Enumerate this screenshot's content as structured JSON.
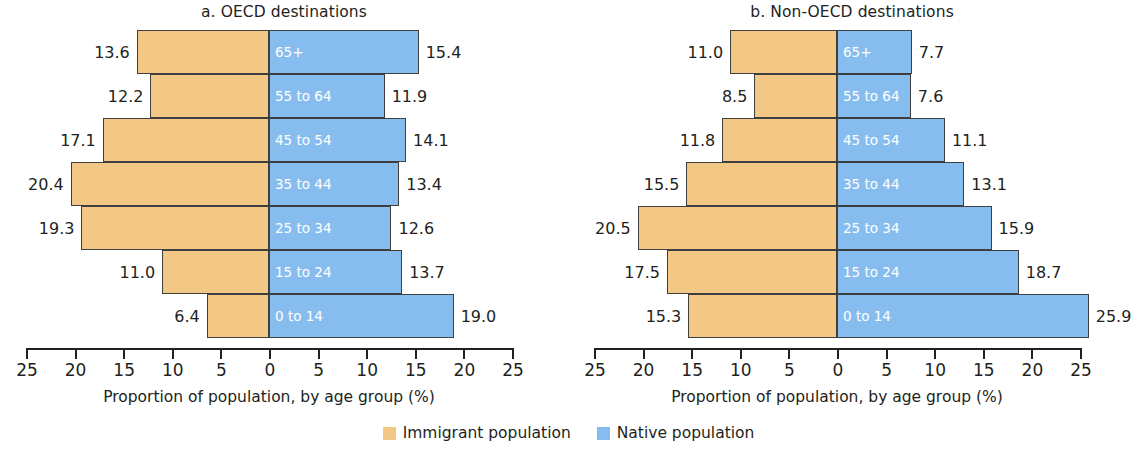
{
  "chart_data": {
    "type": "bar",
    "subtype": "population-pyramid",
    "categories": [
      "0 to 14",
      "15 to 24",
      "25 to 34",
      "35 to 44",
      "45 to 54",
      "55 to 64",
      "65+"
    ],
    "xlabel": "Proportion of population, by age group (%)",
    "ylabel": "",
    "xlim": [
      -25,
      25
    ],
    "xticks": [
      25,
      20,
      15,
      10,
      5,
      0,
      5,
      10,
      15,
      20,
      25
    ],
    "grid": false,
    "legend_position": "bottom-center",
    "legend": [
      {
        "name": "Immigrant population",
        "color": "#f3c784"
      },
      {
        "name": "Native population",
        "color": "#87bdee"
      }
    ],
    "panels": [
      {
        "id": "a",
        "title": "a. OECD destinations",
        "xlabel": "Proportion of population, by age group (%)",
        "series": [
          {
            "name": "Immigrant population",
            "side": "left",
            "color": "#f3c784",
            "values": [
              6.4,
              11.0,
              19.3,
              20.4,
              17.1,
              12.2,
              13.6
            ]
          },
          {
            "name": "Native population",
            "side": "right",
            "color": "#87bdee",
            "values": [
              19.0,
              13.7,
              12.6,
              13.4,
              14.1,
              11.9,
              15.4
            ]
          }
        ]
      },
      {
        "id": "b",
        "title": "b. Non-OECD destinations",
        "xlabel": "Proportion of population, by age group (%)",
        "series": [
          {
            "name": "Immigrant population",
            "side": "left",
            "color": "#f3c784",
            "values": [
              15.3,
              17.5,
              20.5,
              15.5,
              11.8,
              8.5,
              11.0
            ]
          },
          {
            "name": "Native population",
            "side": "right",
            "color": "#87bdee",
            "values": [
              25.9,
              18.7,
              15.9,
              13.1,
              11.1,
              7.6,
              7.7
            ]
          }
        ]
      }
    ]
  },
  "panels": [
    {
      "title": "a. OECD destinations",
      "axis_title": "Proportion of population, by age group (%)",
      "tick_labels": [
        "25",
        "20",
        "15",
        "10",
        "5",
        "0",
        "5",
        "10",
        "15",
        "20",
        "25"
      ],
      "rows": [
        {
          "age": "65+",
          "left": "13.6",
          "right": "15.4"
        },
        {
          "age": "55 to 64",
          "left": "12.2",
          "right": "11.9"
        },
        {
          "age": "45 to 54",
          "left": "17.1",
          "right": "14.1"
        },
        {
          "age": "35 to 44",
          "left": "20.4",
          "right": "13.4"
        },
        {
          "age": "25 to 34",
          "left": "19.3",
          "right": "12.6"
        },
        {
          "age": "15 to 24",
          "left": "11.0",
          "right": "13.7"
        },
        {
          "age": "0 to 14",
          "left": "6.4",
          "right": "19.0"
        }
      ]
    },
    {
      "title": "b. Non-OECD destinations",
      "axis_title": "Proportion of population, by age group (%)",
      "tick_labels": [
        "25",
        "20",
        "15",
        "10",
        "5",
        "0",
        "5",
        "10",
        "15",
        "20",
        "25"
      ],
      "rows": [
        {
          "age": "65+",
          "left": "11.0",
          "right": "7.7"
        },
        {
          "age": "55 to 64",
          "left": "8.5",
          "right": "7.6"
        },
        {
          "age": "45 to 54",
          "left": "11.8",
          "right": "11.1"
        },
        {
          "age": "35 to 44",
          "left": "15.5",
          "right": "13.1"
        },
        {
          "age": "25 to 34",
          "left": "20.5",
          "right": "15.9"
        },
        {
          "age": "15 to 24",
          "left": "17.5",
          "right": "18.7"
        },
        {
          "age": "0 to 14",
          "left": "15.3",
          "right": "25.9"
        }
      ]
    }
  ],
  "legend": {
    "items": [
      {
        "label": "Immigrant population",
        "color": "#f3c784"
      },
      {
        "label": "Native population",
        "color": "#87bdee"
      }
    ]
  }
}
